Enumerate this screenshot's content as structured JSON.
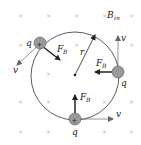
{
  "diagram": {
    "field_label": "B",
    "field_subscript": "in",
    "radius_label": "r",
    "field_marker": "×",
    "charge_symbol": "+",
    "charges": [
      {
        "id": "top-left",
        "charge_label": "q",
        "velocity_label": "v",
        "force_label": "F",
        "force_subscript": "B"
      },
      {
        "id": "right",
        "charge_label": "q",
        "velocity_label": "v",
        "force_label": "F",
        "force_subscript": "B"
      },
      {
        "id": "bottom",
        "charge_label": "q",
        "velocity_label": "v",
        "force_label": "F",
        "force_subscript": "B"
      }
    ],
    "colors": {
      "charge_fill": "#9a9a9a",
      "line": "#333333",
      "arrow": "#222222",
      "field_marker": "#b8b8b8"
    }
  }
}
